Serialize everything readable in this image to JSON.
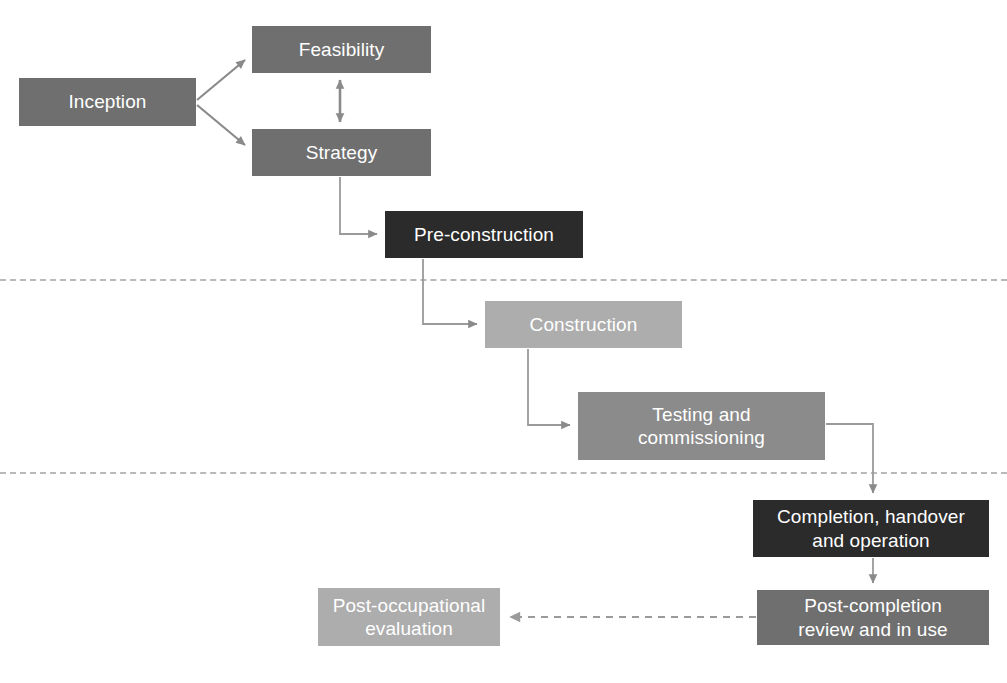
{
  "diagram": {
    "canvas": {
      "width": 1007,
      "height": 683,
      "background": "#ffffff"
    },
    "palette": {
      "dark": "#2b2b2b",
      "mid": "#6f6f6f",
      "mid_light": "#8b8b8b",
      "light": "#adadad",
      "connector": "#8a8a8a",
      "divider": "#b9b9b9",
      "text": "#ffffff"
    },
    "nodes": [
      {
        "id": "inception",
        "label": "Inception",
        "tone": "mid",
        "x": 19,
        "y": 78,
        "w": 177,
        "h": 48
      },
      {
        "id": "feasibility",
        "label": "Feasibility",
        "tone": "mid",
        "x": 252,
        "y": 26,
        "w": 179,
        "h": 47
      },
      {
        "id": "strategy",
        "label": "Strategy",
        "tone": "mid",
        "x": 252,
        "y": 129,
        "w": 179,
        "h": 47
      },
      {
        "id": "pre-construction",
        "label": "Pre-construction",
        "tone": "dark",
        "x": 385,
        "y": 211,
        "w": 198,
        "h": 47
      },
      {
        "id": "construction",
        "label": "Construction",
        "tone": "light",
        "x": 485,
        "y": 301,
        "w": 197,
        "h": 47
      },
      {
        "id": "testing-and-commissioning",
        "label": "Testing and\ncommissioning",
        "tone": "mid_light",
        "x": 578,
        "y": 392,
        "w": 247,
        "h": 68
      },
      {
        "id": "completion-handover-and-operation",
        "label": "Completion, handover\nand operation",
        "tone": "dark",
        "x": 753,
        "y": 500,
        "w": 236,
        "h": 57
      },
      {
        "id": "post-completion-review-and-in-use",
        "label": "Post-completion\nreview and in use",
        "tone": "mid",
        "x": 757,
        "y": 590,
        "w": 232,
        "h": 55
      },
      {
        "id": "post-occupational-evaluation",
        "label": "Post-occupational\nevaluation",
        "tone": "light",
        "x": 318,
        "y": 588,
        "w": 182,
        "h": 58
      }
    ],
    "phase_dividers": [
      {
        "id": "divider-pre-construction-construction",
        "y": 279
      },
      {
        "id": "divider-construction-completion",
        "y": 472
      }
    ],
    "edges": [
      {
        "id": "inception-to-feasibility",
        "from": "inception",
        "to": "feasibility",
        "style": "solid",
        "arrows": "end"
      },
      {
        "id": "inception-to-strategy",
        "from": "inception",
        "to": "strategy",
        "style": "solid",
        "arrows": "end"
      },
      {
        "id": "feasibility-strategy-bidirectional",
        "from": "feasibility",
        "to": "strategy",
        "style": "solid",
        "arrows": "both"
      },
      {
        "id": "strategy-to-pre-construction",
        "from": "strategy",
        "to": "pre-construction",
        "style": "solid",
        "arrows": "end"
      },
      {
        "id": "pre-construction-to-construction",
        "from": "pre-construction",
        "to": "construction",
        "style": "solid",
        "arrows": "end"
      },
      {
        "id": "construction-to-testing",
        "from": "construction",
        "to": "testing-and-commissioning",
        "style": "solid",
        "arrows": "end"
      },
      {
        "id": "testing-to-completion",
        "from": "testing-and-commissioning",
        "to": "completion-handover-and-operation",
        "style": "solid",
        "arrows": "end"
      },
      {
        "id": "completion-to-post-completion-review",
        "from": "completion-handover-and-operation",
        "to": "post-completion-review-and-in-use",
        "style": "solid",
        "arrows": "end"
      },
      {
        "id": "post-completion-review-to-post-occupational-evaluation",
        "from": "post-completion-review-and-in-use",
        "to": "post-occupational-evaluation",
        "style": "dashed",
        "arrows": "end"
      }
    ]
  }
}
